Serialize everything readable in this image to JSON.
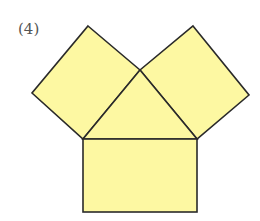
{
  "figure": {
    "label": "(4)",
    "fill_color": "#fdf8a2",
    "stroke_color": "#2a2a2a",
    "shapes": {
      "left_square": "88,26 140,70 83,139 32,93",
      "right_square": "193,26 249,95 197,139 140,70",
      "triangle": "140,70 83,139 197,139",
      "rectangle": {
        "x": 83,
        "y": 139,
        "width": 114,
        "height": 73
      }
    }
  }
}
